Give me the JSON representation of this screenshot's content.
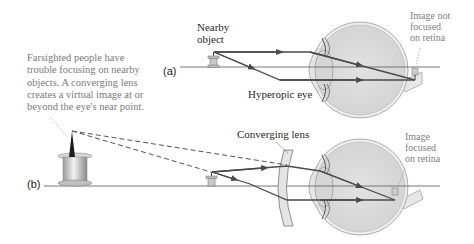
{
  "caption": {
    "lines": [
      "Farsighted people have",
      "trouble focusing on nearby",
      "objects. A converging lens",
      "creates a virtual image at or",
      "beyond the eye's near point."
    ]
  },
  "panel_a": {
    "label": "(a)",
    "object_label": [
      "Nearby",
      "object"
    ],
    "eye_label": "Hyperopic eye",
    "image_label": [
      "Image not",
      "focused",
      "on retina"
    ]
  },
  "panel_b": {
    "label": "(b)",
    "lens_label": "Converging lens",
    "image_label": [
      "Image",
      "focused",
      "on retina"
    ]
  },
  "colors": {
    "ray": "#4a4a4a",
    "axis": "#6a6a6a",
    "eye_fill": "#dcdcdc",
    "eye_outline": "#9a9a9a",
    "lens_fill": "#e4e4e4",
    "note_text": "#7a7a7a"
  }
}
